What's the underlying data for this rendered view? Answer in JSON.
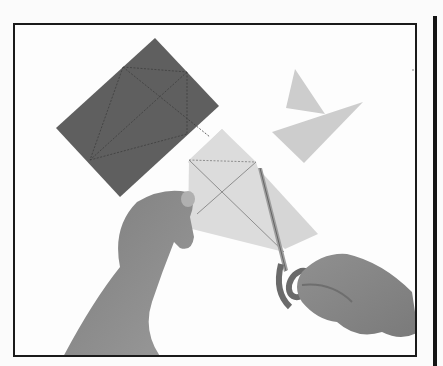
{
  "image": {
    "description": "Black-and-white instructional photo: hands cutting a pale folded paper kite shape with scissors; dark rectangular paper with fold lines at left; cut pale triangular pieces at upper right",
    "colors": {
      "background": "#fdfdfd",
      "dark_paper": "#5f5f5f",
      "pale_paper": "#cfcfcf",
      "skin": "#8a8a8a",
      "frame": "#1a1a1a"
    },
    "elements": [
      {
        "name": "dark-paper-sheet",
        "shape": "rotated rectangle with dashed fold lines"
      },
      {
        "name": "cut-paper-pieces",
        "shape": "two pale triangles"
      },
      {
        "name": "pale-kite-paper",
        "shape": "kite/diamond with crossing fold lines"
      },
      {
        "name": "left-hand",
        "role": "holding paper"
      },
      {
        "name": "right-hand",
        "role": "holding scissors"
      },
      {
        "name": "scissors",
        "role": "cutting tool"
      }
    ]
  }
}
